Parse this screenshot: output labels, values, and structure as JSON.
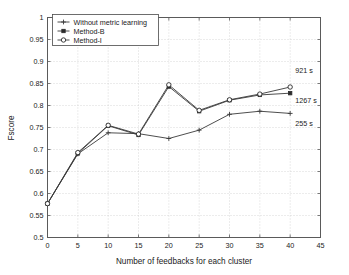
{
  "chart_data": {
    "type": "line",
    "title": "",
    "xlabel": "Number of feedbacks for each cluster",
    "ylabel": "Fscore",
    "xlim": [
      0,
      45
    ],
    "ylim": [
      0.5,
      1
    ],
    "xticks": [
      "0",
      "5",
      "10",
      "15",
      "20",
      "25",
      "30",
      "35",
      "40",
      "45"
    ],
    "xtick_values": [
      0,
      5,
      10,
      15,
      20,
      25,
      30,
      35,
      40,
      45
    ],
    "yticks": [
      "0.5",
      "0.55",
      "0.6",
      "0.65",
      "0.7",
      "0.75",
      "0.8",
      "0.85",
      "0.9",
      "0.95",
      "1"
    ],
    "ytick_values": [
      0.5,
      0.55,
      0.6,
      0.65,
      0.7,
      0.75,
      0.8,
      0.85,
      0.9,
      0.95,
      1.0
    ],
    "grid": true,
    "legend_position": "upper-left",
    "x": [
      0,
      5,
      10,
      15,
      20,
      25,
      30,
      35,
      40
    ],
    "series": [
      {
        "name": "Without metric learning",
        "marker": "plus",
        "values": [
          0.577,
          0.69,
          0.738,
          0.736,
          0.725,
          0.744,
          0.78,
          0.787,
          0.782
        ]
      },
      {
        "name": "Method-B",
        "marker": "square",
        "values": [
          0.577,
          0.691,
          0.754,
          0.733,
          0.843,
          0.787,
          0.812,
          0.824,
          0.828
        ]
      },
      {
        "name": "Method-I",
        "marker": "circle",
        "values": [
          0.577,
          0.693,
          0.755,
          0.735,
          0.847,
          0.789,
          0.813,
          0.826,
          0.842
        ]
      }
    ],
    "annotations": [
      {
        "text": "921 s",
        "x": 40,
        "y": 0.868,
        "dx": 5,
        "dy": -3
      },
      {
        "text": "1267 s",
        "x": 40,
        "y": 0.812,
        "dx": 5,
        "dy": 3
      },
      {
        "text": "255 s",
        "x": 40,
        "y": 0.762,
        "dx": 5,
        "dy": 4
      }
    ],
    "colors": {
      "line": "#3a3a3a",
      "marker_fill": "#2b2b2b",
      "grid": "#c8c8c8",
      "axis": "#5a5a5a",
      "background": "#ffffff"
    }
  }
}
